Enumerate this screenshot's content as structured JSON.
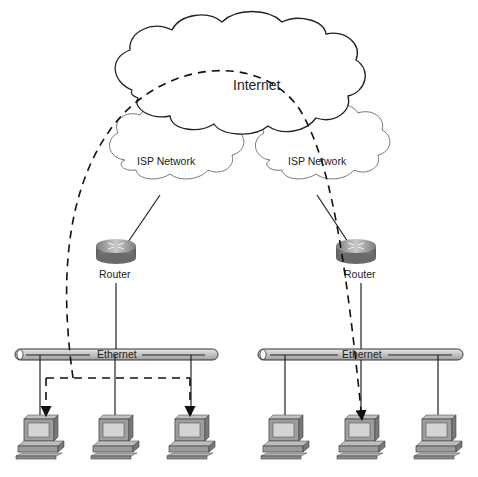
{
  "diagram": {
    "internet": {
      "label": "Internet"
    },
    "isp_networks": [
      {
        "label": "ISP Network"
      },
      {
        "label": "ISP Network"
      }
    ],
    "routers": [
      {
        "label": "Router"
      },
      {
        "label": "Router"
      }
    ],
    "ethernets": [
      {
        "label": "Ethernet"
      },
      {
        "label": "Ethernet"
      }
    ],
    "hosts": [
      {
        "segment": "left",
        "index": 1,
        "dest": true
      },
      {
        "segment": "left",
        "index": 2,
        "dest": false
      },
      {
        "segment": "left",
        "index": 3,
        "dest": true
      },
      {
        "segment": "right",
        "index": 1,
        "dest": false
      },
      {
        "segment": "right",
        "index": 2,
        "dest": true
      },
      {
        "segment": "right",
        "index": 3,
        "dest": false
      }
    ],
    "colors": {
      "line": "#222222",
      "cloud_fill": "#ffffff",
      "cloud_stroke": "#222222",
      "isp_stroke": "#777777",
      "router": "#9a9a9a",
      "bus": "#c8c8c8",
      "monitor": "#9e9e9e",
      "screen": "#d4d4d4"
    }
  }
}
